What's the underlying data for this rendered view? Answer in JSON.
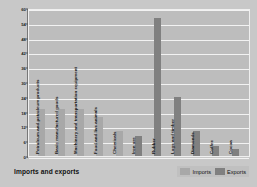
{
  "chart_data": {
    "type": "bar",
    "title": "Imports and exports",
    "xlabel": "",
    "ylabel": "Percentage of total",
    "ylim": [
      0,
      60
    ],
    "yticks": [
      0,
      6,
      12,
      18,
      24,
      30,
      36,
      42,
      48,
      54,
      60
    ],
    "grid": true,
    "legend_position": "bottom-right",
    "categories": [
      "Petroleum and petroleum products",
      "Basic manufactured goods",
      "Machinery and transportation equipment",
      "Food and live animals",
      "Chemicals",
      "Iron ore",
      "Rubber",
      "Logs and timber",
      "Diamonds",
      "Coffee",
      "Cocoa"
    ],
    "series": [
      {
        "name": "Imports",
        "color": "#a8a8a8",
        "values": [
          19,
          19,
          19,
          16,
          10,
          null,
          null,
          null,
          null,
          null,
          null
        ]
      },
      {
        "name": "Exports",
        "color": "#808080",
        "values": [
          null,
          null,
          null,
          null,
          null,
          8,
          56,
          24,
          10,
          4,
          3
        ]
      }
    ],
    "bars": [
      {
        "category": "Petroleum and petroleum products",
        "series": "Imports",
        "value": 19
      },
      {
        "category": "Basic manufactured goods",
        "series": "Imports",
        "value": 19
      },
      {
        "category": "Machinery and transportation equipment",
        "series": "Imports",
        "value": 19
      },
      {
        "category": "Food and live animals",
        "series": "Imports",
        "value": 16
      },
      {
        "category": "Chemicals",
        "series": "Imports",
        "value": 10
      },
      {
        "category": "Iron ore",
        "series": "Exports",
        "value": 8
      },
      {
        "category": "Rubber",
        "series": "Exports",
        "value": 56
      },
      {
        "category": "Logs and timber",
        "series": "Exports",
        "value": 24
      },
      {
        "category": "Diamonds",
        "series": "Exports",
        "value": 10
      },
      {
        "category": "Coffee",
        "series": "Exports",
        "value": 4
      },
      {
        "category": "Cocoa",
        "series": "Exports",
        "value": 3
      }
    ]
  },
  "legend": {
    "items": [
      {
        "label": "Imports",
        "swatch": "imports"
      },
      {
        "label": "Exports",
        "swatch": "exports"
      }
    ]
  }
}
